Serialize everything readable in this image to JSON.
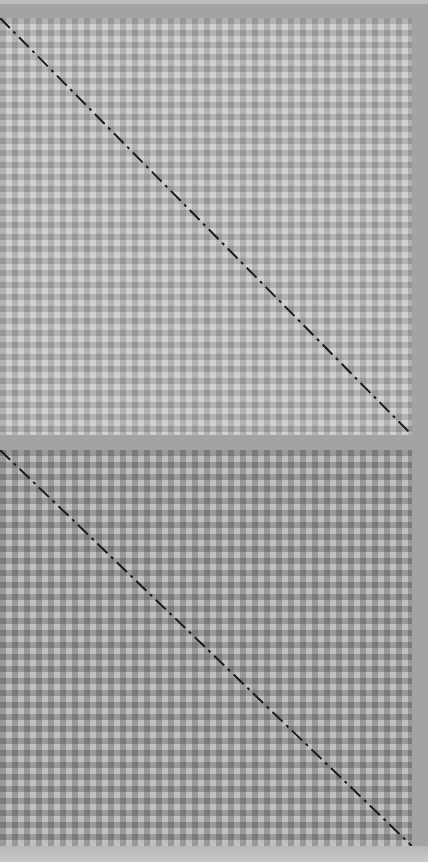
{
  "panels": [
    {
      "id": "top",
      "pattern": "gingham",
      "light_color": "#d0d0d0",
      "mid_color": "#b0b0b0",
      "dark_color": "#969696",
      "cell_size": 12,
      "diagonal": {
        "style": "dash-dot",
        "color": "#1a1a1a"
      }
    },
    {
      "id": "bottom",
      "pattern": "gingham",
      "light_color": "#bdbdbd",
      "mid_color": "#989898",
      "dark_color": "#7a7a7a",
      "cell_size": 12,
      "diagonal": {
        "style": "dash-dot",
        "color": "#1a1a1a"
      }
    }
  ],
  "frame_color": "#a3a3a3"
}
